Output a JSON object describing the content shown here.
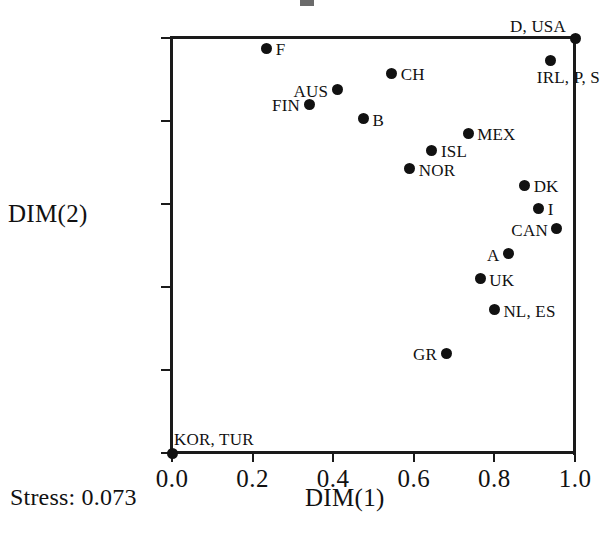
{
  "chart_data": {
    "type": "scatter",
    "title": "",
    "xlabel": "DIM(1)",
    "ylabel": "DIM(2)",
    "xlim": [
      0.0,
      1.0
    ],
    "ylim": [
      0.0,
      1.0
    ],
    "xticks": [
      "0.0",
      "0.2",
      "0.4",
      "0.6",
      "0.8",
      "1.0"
    ],
    "yticks": [
      "0.0",
      "0.2",
      "0.4",
      "0.6",
      "0.8",
      "1.0"
    ],
    "xtick_values": [
      0.0,
      0.2,
      0.4,
      0.6,
      0.8,
      1.0
    ],
    "ytick_values": [
      0.0,
      0.2,
      0.4,
      0.6,
      0.8,
      1.0
    ],
    "grid": false,
    "legend": "none",
    "annotation": "Stress: 0.073",
    "marker_color": "#111111",
    "axis_color": "#1a1a1a",
    "points": [
      {
        "label": "F",
        "x": 0.235,
        "y": 0.975,
        "pos": "lab-right"
      },
      {
        "label": "D, USA",
        "x": 1.0,
        "y": 1.0,
        "pos": "lab-upleft"
      },
      {
        "label": "IRL, P, S",
        "x": 0.94,
        "y": 0.945,
        "pos": "lab-downright"
      },
      {
        "label": "CH",
        "x": 0.545,
        "y": 0.915,
        "pos": "lab-right"
      },
      {
        "label": "AUS",
        "x": 0.41,
        "y": 0.875,
        "pos": "lab-left"
      },
      {
        "label": "FIN",
        "x": 0.34,
        "y": 0.84,
        "pos": "lab-left"
      },
      {
        "label": "B",
        "x": 0.475,
        "y": 0.805,
        "pos": "lab-right"
      },
      {
        "label": "MEX",
        "x": 0.735,
        "y": 0.77,
        "pos": "lab-right"
      },
      {
        "label": "ISL",
        "x": 0.645,
        "y": 0.73,
        "pos": "lab-right"
      },
      {
        "label": "NOR",
        "x": 0.59,
        "y": 0.685,
        "pos": "lab-right"
      },
      {
        "label": "DK",
        "x": 0.875,
        "y": 0.645,
        "pos": "lab-right"
      },
      {
        "label": "I",
        "x": 0.91,
        "y": 0.59,
        "pos": "lab-right"
      },
      {
        "label": "CAN",
        "x": 0.955,
        "y": 0.54,
        "pos": "lab-left"
      },
      {
        "label": "A",
        "x": 0.835,
        "y": 0.48,
        "pos": "lab-left"
      },
      {
        "label": "UK",
        "x": 0.765,
        "y": 0.42,
        "pos": "lab-right"
      },
      {
        "label": "NL, ES",
        "x": 0.8,
        "y": 0.345,
        "pos": "lab-right"
      },
      {
        "label": "GR",
        "x": 0.68,
        "y": 0.24,
        "pos": "lab-left"
      },
      {
        "label": "KOR, TUR",
        "x": 0.0,
        "y": 0.0,
        "pos": "lab-upright"
      }
    ]
  }
}
